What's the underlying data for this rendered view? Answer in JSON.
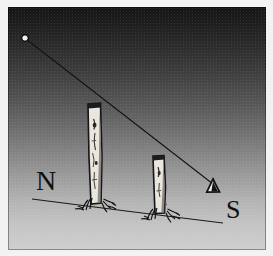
{
  "figure": {
    "type": "line-drawing",
    "frame_color": "#f2f2f2",
    "ink_color": "#101010"
  },
  "sky": {
    "description": "vertical gradient night sky, dark at zenith, bright near horizon",
    "top_color": "#161616",
    "bottom_color": "#cfcfcf"
  },
  "labels": {
    "north": "N",
    "south": "S"
  },
  "markers": {
    "star": {
      "name": "star",
      "x": 17,
      "y": 31,
      "color": "#f0f0f0"
    },
    "observer": {
      "name": "observer-eye-triangle",
      "glyph": "triangle",
      "x": 205,
      "y": 176,
      "outline_color": "#101010",
      "fill_color": "#e8e8e8"
    }
  },
  "sight_line": {
    "name": "line-of-sight",
    "from_x": 18,
    "from_y": 32,
    "to_x": 205,
    "to_y": 177,
    "color": "#141414",
    "width": 1
  },
  "ground_line": {
    "name": "horizon-ground-line",
    "from_x": 24,
    "from_y": 192,
    "to_x": 215,
    "to_y": 216,
    "color": "#1a1a1a",
    "width": 1
  },
  "posts": [
    {
      "name": "tall-post",
      "x": 80,
      "top_y": 96,
      "base_y": 196,
      "width": 13,
      "height": 100,
      "fill_color": "#e6e3dc",
      "outline_color": "#121212"
    },
    {
      "name": "short-post",
      "x": 145,
      "top_y": 148,
      "base_y": 206,
      "width": 12,
      "height": 58,
      "fill_color": "#e6e3dc",
      "outline_color": "#121212"
    }
  ],
  "grass_tufts": [
    {
      "name": "grass-tuft-tall-post",
      "x": 86,
      "y": 196
    },
    {
      "name": "grass-tuft-short-post",
      "x": 151,
      "y": 206
    }
  ]
}
